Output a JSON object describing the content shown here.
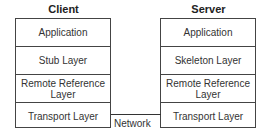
{
  "client": {
    "title": "Client",
    "layers": [
      "Application",
      "Stub Layer",
      "Remote Reference Layer",
      "Transport Layer"
    ]
  },
  "server": {
    "title": "Server",
    "layers": [
      "Application",
      "Skeleton Layer",
      "Remote Reference Layer",
      "Transport Layer"
    ]
  },
  "network": {
    "label": "Network"
  }
}
